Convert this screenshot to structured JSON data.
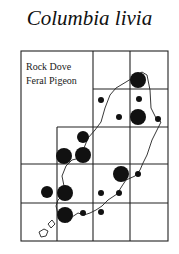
{
  "figure": {
    "title": "Columbia livia",
    "legend": {
      "lines": [
        "Rock Dove",
        "Feral Pigeon"
      ]
    }
  },
  "colors": {
    "ink": "#111111",
    "background": "#ffffff"
  },
  "map": {
    "grid": {
      "cells_wide": 4,
      "cells_tall": 5,
      "x_lines": [
        21,
        57,
        93,
        130,
        168
      ],
      "y_lines": [
        51,
        89,
        127,
        164,
        203,
        241
      ]
    },
    "records": [
      {
        "x": 138,
        "y": 80,
        "size": "large"
      },
      {
        "x": 101,
        "y": 100,
        "size": "small"
      },
      {
        "x": 139,
        "y": 99,
        "size": "small"
      },
      {
        "x": 119,
        "y": 117,
        "size": "small"
      },
      {
        "x": 138,
        "y": 117,
        "size": "large"
      },
      {
        "x": 158,
        "y": 119,
        "size": "small"
      },
      {
        "x": 83,
        "y": 137,
        "size": "medium"
      },
      {
        "x": 64,
        "y": 156,
        "size": "large"
      },
      {
        "x": 83,
        "y": 155,
        "size": "large"
      },
      {
        "x": 121,
        "y": 174,
        "size": "large"
      },
      {
        "x": 138,
        "y": 174,
        "size": "small"
      },
      {
        "x": 47,
        "y": 192,
        "size": "medium"
      },
      {
        "x": 65,
        "y": 193,
        "size": "large"
      },
      {
        "x": 65,
        "y": 215,
        "size": "large"
      },
      {
        "x": 101,
        "y": 193,
        "size": "small"
      },
      {
        "x": 119,
        "y": 193,
        "size": "small"
      },
      {
        "x": 101,
        "y": 212,
        "size": "small"
      },
      {
        "x": 83,
        "y": 213,
        "size": "small"
      }
    ]
  }
}
